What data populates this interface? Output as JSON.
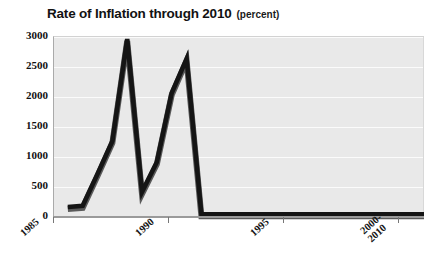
{
  "chart": {
    "title_main": "Rate of Inflation through 2010",
    "title_unit": "(percent)",
    "background_plot": "#e9e9e9",
    "line_color": "#1a1a1a"
  },
  "chart_data": {
    "type": "line",
    "title": "Rate of Inflation through 2010 (percent)",
    "xlabel": "",
    "ylabel": "",
    "unit": "percent",
    "grid": true,
    "legend": "none",
    "ylim": [
      0,
      3000
    ],
    "yticks": [
      0,
      500,
      1000,
      1500,
      2000,
      2500,
      3000
    ],
    "ytick_labels": [
      "0",
      "500",
      "1000",
      "1500",
      "2000",
      "2500",
      "3000"
    ],
    "xticks": [
      1985,
      1990,
      1995,
      2000
    ],
    "xtick_labels": [
      "1985",
      "1990",
      "1995",
      "2000-\n2010"
    ],
    "xtick_labels_flat": [
      "1985",
      "1990",
      "1995",
      "2000-2010"
    ],
    "xlim": [
      1985,
      2010
    ],
    "x": [
      1986,
      1987,
      1988,
      1989,
      1990,
      1991,
      1992,
      1993,
      1994,
      1995,
      1996,
      2000,
      2010
    ],
    "values": [
      150,
      170,
      700,
      1250,
      2950,
      400,
      900,
      2050,
      2620,
      30,
      30,
      30,
      30
    ],
    "series": [
      {
        "name": "Rate of Inflation",
        "values": [
          150,
          170,
          700,
          1250,
          2950,
          400,
          900,
          2050,
          2620,
          30,
          30,
          30,
          30
        ]
      }
    ]
  },
  "axes": {
    "y": [
      {
        "label": "3000",
        "value": 3000
      },
      {
        "label": "2500",
        "value": 2500
      },
      {
        "label": "2000",
        "value": 2000
      },
      {
        "label": "1500",
        "value": 1500
      },
      {
        "label": "1000",
        "value": 1000
      },
      {
        "label": "500",
        "value": 500
      },
      {
        "label": "0",
        "value": 0
      }
    ],
    "x": [
      {
        "label": "1985",
        "line2": "",
        "value": 1985
      },
      {
        "label": "1990",
        "line2": "",
        "value": 1990
      },
      {
        "label": "1995",
        "line2": "",
        "value": 1995
      },
      {
        "label": "2000-",
        "line2": "2010",
        "value": 2000
      }
    ]
  }
}
